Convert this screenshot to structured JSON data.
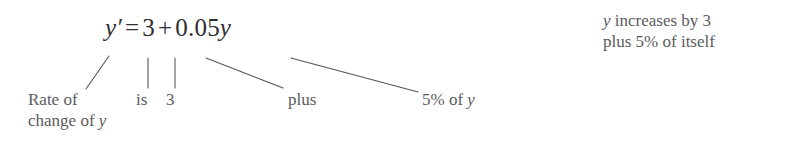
{
  "canvas": {
    "width": 786,
    "height": 144,
    "background": "#ffffff",
    "ink_color": "#55555a",
    "equation_color": "#2e2e33",
    "leader_color": "#55555a"
  },
  "equation": {
    "full_text": "y′ = 3 + 0.05y",
    "lhs_var": "y′",
    "equals": "=",
    "constant": "3",
    "plus": "+",
    "coefficient": "0.05",
    "rhs_var": "y"
  },
  "callouts": [
    {
      "name": "rate-of-change",
      "line_1": "Rate of",
      "line_2_prefix": "change of ",
      "line_2_var": "y"
    },
    {
      "name": "is",
      "text": "is"
    },
    {
      "name": "three",
      "text": "3"
    },
    {
      "name": "plus",
      "text": "plus"
    },
    {
      "name": "five-percent-of-y",
      "prefix": "5% of ",
      "var": "y"
    }
  ],
  "gloss": {
    "line_1_var": "y",
    "line_1_rest": " increases by 3",
    "line_2": "plus 5% of itself"
  },
  "leaders": [
    {
      "name": "leader-slash-rate",
      "x1": 109,
      "y1": 56,
      "x2": 86,
      "y2": 89
    },
    {
      "name": "leader-vertical-is",
      "x1": 148,
      "y1": 58,
      "x2": 148,
      "y2": 88
    },
    {
      "name": "leader-vertical-3",
      "x1": 175,
      "y1": 58,
      "x2": 175,
      "y2": 88
    },
    {
      "name": "leader-diagonal-plus",
      "x1": 206,
      "y1": 58,
      "x2": 283,
      "y2": 88
    },
    {
      "name": "leader-diagonal-pct",
      "x1": 291,
      "y1": 58,
      "x2": 418,
      "y2": 92
    }
  ]
}
